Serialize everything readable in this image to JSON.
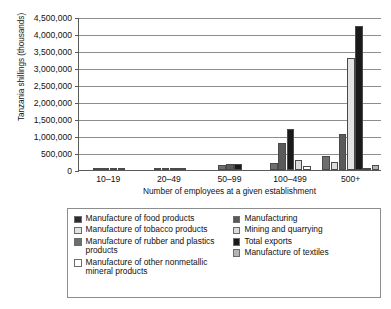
{
  "chart_data": {
    "type": "bar",
    "title": "",
    "xlabel": "Number of employees at a given establishment",
    "ylabel": "Tanzania shillings (thousands)",
    "categories": [
      "10–19",
      "20–49",
      "50–99",
      "100–499",
      "500+"
    ],
    "ylim": [
      0,
      4500000
    ],
    "ytick_labels": [
      "4,500,000",
      "4,000,000",
      "3,500,000",
      "3,000,000",
      "2,500,000",
      "2,000,000",
      "1,500,000",
      "1,000,000",
      "500,000",
      "0"
    ],
    "ytick_values": [
      4500000,
      4000000,
      3500000,
      3000000,
      2500000,
      2000000,
      1500000,
      1000000,
      500000,
      0
    ],
    "grid": true,
    "legend_position": "below",
    "series": [
      {
        "name": "Manufacture of food products",
        "color": "#2b2b2b",
        "values": [
          15000,
          10000,
          0,
          0,
          0
        ]
      },
      {
        "name": "Manufacture of tobacco products",
        "color": "#e3e3e3",
        "values": [
          0,
          0,
          0,
          0,
          3300000
        ]
      },
      {
        "name": "Manufacture of rubber and plastics products",
        "color": "#6e6e6e",
        "values": [
          18000,
          22000,
          150000,
          200000,
          400000
        ]
      },
      {
        "name": "Manufacture of other nonmetallic mineral products",
        "color": "#ffffff",
        "values": [
          0,
          0,
          0,
          120000,
          60000
        ]
      },
      {
        "name": "Manufacturing",
        "color": "#5a5a5a",
        "values": [
          20000,
          30000,
          170000,
          800000,
          1050000
        ]
      },
      {
        "name": "Mining and quarrying",
        "color": "#dcdcdc",
        "values": [
          0,
          0,
          0,
          300000,
          230000
        ]
      },
      {
        "name": "Total exports",
        "color": "#1a1a1a",
        "values": [
          20000,
          45000,
          185000,
          1200000,
          4250000
        ]
      },
      {
        "name": "Manufacture of textiles",
        "color": "#b4b4b4",
        "values": [
          0,
          0,
          0,
          0,
          150000
        ]
      }
    ],
    "groups": [
      {
        "category": "10–19",
        "bars": [
          {
            "series": "Manufacture of food products",
            "color": "#2b2b2b",
            "value": 15000
          },
          {
            "series": "Manufacture of rubber and plastics products",
            "color": "#6e6e6e",
            "value": 18000
          },
          {
            "series": "Manufacturing",
            "color": "#5a5a5a",
            "value": 20000
          },
          {
            "series": "Total exports",
            "color": "#1a1a1a",
            "value": 20000
          }
        ]
      },
      {
        "category": "20–49",
        "bars": [
          {
            "series": "Manufacture of food products",
            "color": "#2b2b2b",
            "value": 12000
          },
          {
            "series": "Manufacture of rubber and plastics products",
            "color": "#6e6e6e",
            "value": 22000
          },
          {
            "series": "Manufacturing",
            "color": "#5a5a5a",
            "value": 30000
          },
          {
            "series": "Total exports",
            "color": "#1a1a1a",
            "value": 45000
          }
        ]
      },
      {
        "category": "50–99",
        "bars": [
          {
            "series": "Manufacture of rubber and plastics products",
            "color": "#6e6e6e",
            "value": 150000
          },
          {
            "series": "Manufacturing",
            "color": "#5a5a5a",
            "value": 170000
          },
          {
            "series": "Total exports",
            "color": "#1a1a1a",
            "value": 185000
          }
        ]
      },
      {
        "category": "100–499",
        "bars": [
          {
            "series": "Manufacture of rubber and plastics products",
            "color": "#6e6e6e",
            "value": 200000
          },
          {
            "series": "Manufacturing",
            "color": "#5a5a5a",
            "value": 800000
          },
          {
            "series": "Total exports",
            "color": "#1a1a1a",
            "value": 1200000
          },
          {
            "series": "Mining and quarrying",
            "color": "#dcdcdc",
            "value": 300000
          },
          {
            "series": "Manufacture of other nonmetallic mineral products",
            "color": "#ffffff",
            "value": 120000
          }
        ]
      },
      {
        "category": "500+",
        "bars": [
          {
            "series": "Manufacture of rubber and plastics products",
            "color": "#6e6e6e",
            "value": 400000
          },
          {
            "series": "Mining and quarrying",
            "color": "#dcdcdc",
            "value": 230000
          },
          {
            "series": "Manufacturing",
            "color": "#5a5a5a",
            "value": 1050000
          },
          {
            "series": "Manufacture of tobacco products",
            "color": "#e3e3e3",
            "value": 3300000
          },
          {
            "series": "Total exports",
            "color": "#1a1a1a",
            "value": 4250000
          },
          {
            "series": "Manufacture of other nonmetallic mineral products",
            "color": "#ffffff",
            "value": 60000
          },
          {
            "series": "Manufacture of textiles",
            "color": "#b4b4b4",
            "value": 150000
          }
        ]
      }
    ],
    "legend": {
      "left_column": [
        {
          "label": "Manufacture of food products",
          "color": "#2b2b2b"
        },
        {
          "label": "Manufacture of tobacco products",
          "color": "#e3e3e3"
        },
        {
          "label": "Manufacture of rubber and plastics products",
          "color": "#6e6e6e"
        },
        {
          "label": "Manufacture of other nonmetallic mineral products",
          "color": "#ffffff"
        }
      ],
      "right_column": [
        {
          "label": "Manufacturing",
          "color": "#5a5a5a"
        },
        {
          "label": "Mining and quarrying",
          "color": "#dcdcdc"
        },
        {
          "label": "Total exports",
          "color": "#1a1a1a"
        },
        {
          "label": "Manufacture of textiles",
          "color": "#b4b4b4"
        }
      ]
    }
  }
}
